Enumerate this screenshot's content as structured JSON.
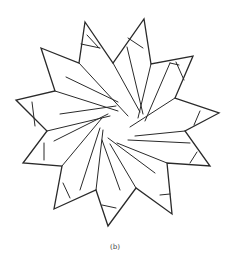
{
  "figure": {
    "type": "geometric star dissection",
    "points_count": 11,
    "stroke_color": "#2a2a2a",
    "background": "#ffffff",
    "outline": [
      [
        85,
        22
      ],
      [
        113,
        63
      ],
      [
        144,
        19
      ],
      [
        151,
        64
      ],
      [
        193,
        56
      ],
      [
        175,
        98
      ],
      [
        219,
        113
      ],
      [
        185,
        131
      ],
      [
        210,
        166
      ],
      [
        167,
        163
      ],
      [
        172,
        214
      ],
      [
        136,
        188
      ],
      [
        108,
        226
      ],
      [
        96,
        190
      ],
      [
        54,
        209
      ],
      [
        62,
        166
      ],
      [
        23,
        163
      ],
      [
        47,
        131
      ],
      [
        16,
        100
      ],
      [
        55,
        91
      ],
      [
        41,
        48
      ],
      [
        79,
        63
      ]
    ],
    "inner_lines": [
      [
        [
          79,
          63
        ],
        [
          128,
          116
        ]
      ],
      [
        [
          113,
          63
        ],
        [
          140,
          112
        ]
      ],
      [
        [
          127,
          47
        ],
        [
          143,
          114
        ]
      ],
      [
        [
          151,
          64
        ],
        [
          138,
          118
        ]
      ],
      [
        [
          170,
          63
        ],
        [
          145,
          121
        ]
      ],
      [
        [
          175,
          98
        ],
        [
          130,
          127
        ]
      ],
      [
        [
          185,
          131
        ],
        [
          135,
          136
        ]
      ],
      [
        [
          190,
          143
        ],
        [
          128,
          140
        ]
      ],
      [
        [
          167,
          163
        ],
        [
          117,
          143
        ]
      ],
      [
        [
          155,
          173
        ],
        [
          108,
          138
        ]
      ],
      [
        [
          136,
          188
        ],
        [
          110,
          144
        ]
      ],
      [
        [
          120,
          190
        ],
        [
          102,
          140
        ]
      ],
      [
        [
          96,
          190
        ],
        [
          103,
          130
        ]
      ],
      [
        [
          80,
          190
        ],
        [
          100,
          128
        ]
      ],
      [
        [
          62,
          166
        ],
        [
          102,
          118
        ]
      ],
      [
        [
          54,
          141
        ],
        [
          108,
          114
        ]
      ],
      [
        [
          47,
          131
        ],
        [
          110,
          116
        ]
      ],
      [
        [
          60,
          114
        ],
        [
          116,
          106
        ]
      ],
      [
        [
          55,
          91
        ],
        [
          118,
          111
        ]
      ],
      [
        [
          66,
          77
        ],
        [
          118,
          102
        ]
      ],
      [
        [
          87,
          35
        ],
        [
          99,
          48
        ]
      ],
      [
        [
          81,
          44
        ],
        [
          100,
          48
        ]
      ],
      [
        [
          128,
          38
        ],
        [
          143,
          48
        ]
      ],
      [
        [
          179,
          65
        ],
        [
          170,
          63
        ]
      ],
      [
        [
          176,
          62
        ],
        [
          184,
          80
        ]
      ],
      [
        [
          200,
          111
        ],
        [
          194,
          125
        ]
      ],
      [
        [
          197,
          152
        ],
        [
          190,
          163
        ]
      ],
      [
        [
          160,
          195
        ],
        [
          170,
          194
        ]
      ],
      [
        [
          102,
          205
        ],
        [
          116,
          208
        ]
      ],
      [
        [
          63,
          183
        ],
        [
          70,
          198
        ]
      ],
      [
        [
          44,
          143
        ],
        [
          44,
          160
        ]
      ],
      [
        [
          35,
          126
        ],
        [
          32,
          102
        ]
      ]
    ]
  },
  "caption": "(b)"
}
